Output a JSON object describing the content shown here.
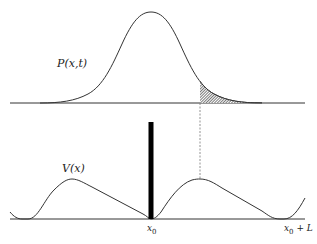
{
  "figure": {
    "top_panel": {
      "curve_label": "P(x,t)",
      "curve_type": "gaussian-probability-density",
      "shaded_tail": "region right of dashed line"
    },
    "bottom_panel": {
      "curve_label": "V(x)",
      "barrier": "thick vertical wall at x0",
      "axis_labels": {
        "x0_main": "x",
        "x0_sub": "0",
        "x0L_main": "x",
        "x0L_sub": "0",
        "x0L_suffix": " + L"
      }
    },
    "colors": {
      "line": "#333333",
      "wall": "#000000",
      "hatch": "#444444",
      "dashed": "#777777"
    }
  }
}
